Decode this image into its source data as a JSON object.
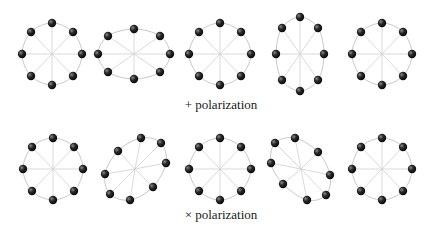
{
  "colors": {
    "ring": "#c8c8c8",
    "spoke": "#cfcfcf",
    "particle_dark": "#111111",
    "particle_light": "#777777",
    "text": "#1a1a1a"
  },
  "rows": [
    {
      "label": "+ polarization",
      "label_pos": {
        "x": 221,
        "y": 97
      },
      "rings": [
        {
          "cx": 52,
          "cy": 54,
          "points": [
            [
              52,
              23
            ],
            [
              73,
              32
            ],
            [
              82,
              54
            ],
            [
              73,
              76
            ],
            [
              52,
              85
            ],
            [
              31,
              76
            ],
            [
              22,
              54
            ],
            [
              31,
              32
            ]
          ]
        },
        {
          "cx": 134,
          "cy": 54,
          "points": [
            [
              134,
              29
            ],
            [
              160,
              36
            ],
            [
              170,
              54
            ],
            [
              160,
              72
            ],
            [
              134,
              79
            ],
            [
              108,
              72
            ],
            [
              98,
              54
            ],
            [
              108,
              36
            ]
          ]
        },
        {
          "cx": 220,
          "cy": 54,
          "points": [
            [
              220,
              23
            ],
            [
              241,
              32
            ],
            [
              251,
              54
            ],
            [
              241,
              76
            ],
            [
              220,
              85
            ],
            [
              199,
              76
            ],
            [
              189,
              54
            ],
            [
              199,
              32
            ]
          ]
        },
        {
          "cx": 300,
          "cy": 54,
          "points": [
            [
              300,
              17
            ],
            [
              318,
              28
            ],
            [
              324,
              54
            ],
            [
              318,
              80
            ],
            [
              300,
              91
            ],
            [
              282,
              80
            ],
            [
              276,
              54
            ],
            [
              282,
              28
            ]
          ]
        },
        {
          "cx": 382,
          "cy": 54,
          "points": [
            [
              382,
              23
            ],
            [
              403,
              32
            ],
            [
              412,
              54
            ],
            [
              403,
              76
            ],
            [
              382,
              85
            ],
            [
              361,
              76
            ],
            [
              352,
              54
            ],
            [
              361,
              32
            ]
          ]
        }
      ]
    },
    {
      "label": "× polarization",
      "label_pos": {
        "x": 221,
        "y": 207
      },
      "rings": [
        {
          "cx": 53,
          "cy": 169,
          "points": [
            [
              53,
              138
            ],
            [
              74,
              147
            ],
            [
              83,
              169
            ],
            [
              74,
              191
            ],
            [
              53,
              200
            ],
            [
              32,
              191
            ],
            [
              23,
              169
            ],
            [
              32,
              147
            ]
          ]
        },
        {
          "cx": 135,
          "cy": 169,
          "points": [
            [
              141,
              138
            ],
            [
              161,
              143
            ],
            [
              166,
              163
            ],
            [
              153,
              187
            ],
            [
              130,
              200
            ],
            [
              110,
              194
            ],
            [
              105,
              174
            ],
            [
              118,
              151
            ]
          ]
        },
        {
          "cx": 220,
          "cy": 169,
          "points": [
            [
              220,
              138
            ],
            [
              241,
              147
            ],
            [
              251,
              169
            ],
            [
              241,
              191
            ],
            [
              220,
              200
            ],
            [
              199,
              191
            ],
            [
              189,
              169
            ],
            [
              199,
              147
            ]
          ]
        },
        {
          "cx": 301,
          "cy": 169,
          "points": [
            [
              295,
              138
            ],
            [
              318,
              152
            ],
            [
              330,
              175
            ],
            [
              326,
              195
            ],
            [
              307,
              200
            ],
            [
              283,
              184
            ],
            [
              271,
              163
            ],
            [
              275,
              143
            ]
          ]
        },
        {
          "cx": 382,
          "cy": 169,
          "points": [
            [
              382,
              138
            ],
            [
              403,
              147
            ],
            [
              412,
              169
            ],
            [
              403,
              191
            ],
            [
              382,
              200
            ],
            [
              361,
              191
            ],
            [
              352,
              169
            ],
            [
              361,
              147
            ]
          ]
        }
      ]
    }
  ]
}
